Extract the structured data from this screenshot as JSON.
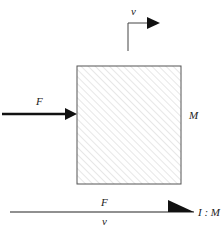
{
  "diagram": {
    "mass_label": "M",
    "force_label": "F",
    "velocity_label": "v",
    "bond": {
      "effort_label": "F",
      "flow_label": "v",
      "element_label": "I : M"
    }
  }
}
